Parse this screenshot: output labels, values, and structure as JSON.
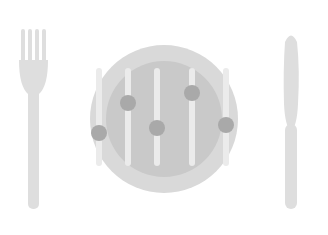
{
  "canvas": {
    "width": 328,
    "height": 235,
    "background": "#ffffff",
    "title": "Food Settings Icon",
    "description": "Flat grayscale illustration of a dinner plate with five vertical slider controls, flanked by a fork on the left and a knife on the right"
  },
  "palette": {
    "background": "#ffffff",
    "plate_rim": "#d9d9d9",
    "plate_inner": "#c9c9c9",
    "slider_track": "#ebebeb",
    "slider_knob": "#a9a9a9",
    "cutlery": "#dedede"
  },
  "fork": {
    "name": "fork",
    "label": "Fork",
    "tine_count": 4,
    "x_center": 33,
    "top": 29,
    "bottom": 209,
    "color": "#dedede"
  },
  "knife": {
    "name": "knife",
    "label": "Knife",
    "x_center": 291,
    "top": 31,
    "bottom": 209,
    "color": "#dedede"
  },
  "plate": {
    "name": "plate",
    "label": "Plate",
    "center_x": 164,
    "center_y": 119,
    "outer_radius": 74,
    "inner_radius": 58,
    "rim_color": "#d9d9d9",
    "inner_color": "#c9c9c9"
  },
  "sliders": {
    "label": "Slider controls",
    "count": 5,
    "track_top": 68,
    "track_bottom": 166,
    "track_width": 6,
    "knob_radius": 8,
    "items": [
      {
        "name": "slider-1",
        "label": "Slider 1",
        "x": 99,
        "knob_y": 133,
        "value": 34
      },
      {
        "name": "slider-2",
        "label": "Slider 2",
        "x": 128,
        "knob_y": 103,
        "value": 64
      },
      {
        "name": "slider-3",
        "label": "Slider 3",
        "x": 157,
        "knob_y": 128,
        "value": 39
      },
      {
        "name": "slider-4",
        "label": "Slider 4",
        "x": 192,
        "knob_y": 93,
        "value": 74
      },
      {
        "name": "slider-5",
        "label": "Slider 5",
        "x": 226,
        "knob_y": 125,
        "value": 42
      }
    ]
  }
}
